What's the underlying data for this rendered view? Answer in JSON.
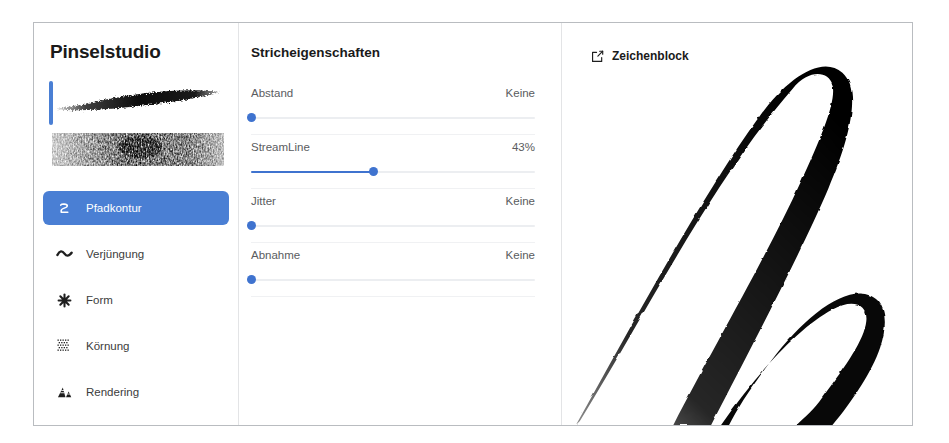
{
  "app": {
    "title": "Pinselstudio"
  },
  "sidebar": {
    "brush_previews": [
      {
        "name": "brush-preview-tapered-stroke"
      },
      {
        "name": "brush-preview-textured-block"
      }
    ],
    "selected_brush_index": 0,
    "items": [
      {
        "label": "Pfadkontur",
        "icon": "path-outline-icon",
        "selected": true
      },
      {
        "label": "Verjüngung",
        "icon": "taper-wave-icon",
        "selected": false
      },
      {
        "label": "Form",
        "icon": "shape-star-icon",
        "selected": false
      },
      {
        "label": "Körnung",
        "icon": "grain-grid-icon",
        "selected": false
      },
      {
        "label": "Rendering",
        "icon": "rendering-mountain-icon",
        "selected": false
      }
    ]
  },
  "properties": {
    "title": "Stricheigenschaften",
    "sliders": [
      {
        "label": "Abstand",
        "value": "Keine",
        "percent": 0
      },
      {
        "label": "StreamLine",
        "value": "43%",
        "percent": 43
      },
      {
        "label": "Jitter",
        "value": "Keine",
        "percent": 0
      },
      {
        "label": "Abnahme",
        "value": "Keine",
        "percent": 0
      }
    ]
  },
  "canvas": {
    "header_label": "Zeichenblock",
    "header_icon": "edit-square-icon"
  },
  "colors": {
    "accent": "#4a7fd4",
    "slider_accent": "#3f73cf",
    "text_primary": "#1a1a1a",
    "text_secondary": "#5a5c60",
    "border": "#b9bcc0",
    "divider": "#e3e4e6"
  }
}
